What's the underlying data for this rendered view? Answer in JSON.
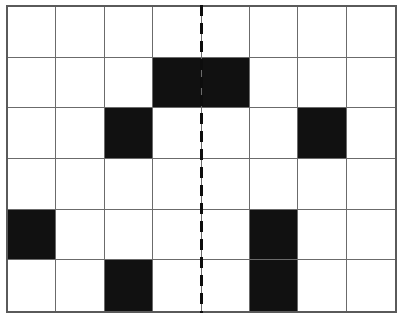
{
  "figure": {
    "kind": "symmetry-grid",
    "title": "",
    "caption": "",
    "background_color": "#ffffff"
  },
  "grid": {
    "columns": 8,
    "rows": 6,
    "cell_fill_color": "#111111",
    "cell_empty_color": "#ffffff",
    "grid_line_color": "#6b6b6b",
    "outer_border_color": "#5a5a5a",
    "filled_cells": [
      {
        "row": 1,
        "col": 3
      },
      {
        "row": 1,
        "col": 4
      },
      {
        "row": 2,
        "col": 2
      },
      {
        "row": 2,
        "col": 6
      },
      {
        "row": 4,
        "col": 0
      },
      {
        "row": 4,
        "col": 5
      },
      {
        "row": 5,
        "col": 2
      },
      {
        "row": 5,
        "col": 5
      }
    ],
    "cells": [
      [
        0,
        0,
        0,
        0,
        0,
        0,
        0,
        0
      ],
      [
        0,
        0,
        0,
        1,
        1,
        0,
        0,
        0
      ],
      [
        0,
        0,
        1,
        0,
        0,
        0,
        1,
        0
      ],
      [
        0,
        0,
        0,
        0,
        0,
        0,
        0,
        0
      ],
      [
        1,
        0,
        0,
        0,
        0,
        1,
        0,
        0
      ],
      [
        0,
        0,
        1,
        0,
        0,
        1,
        0,
        0
      ]
    ]
  },
  "symmetry_axis": {
    "orientation": "vertical",
    "position_column_boundary": 4,
    "style": "dashed",
    "color": "#0d0d0d",
    "dash_length_px": 11,
    "gap_length_px": 7,
    "width_px": 3
  }
}
